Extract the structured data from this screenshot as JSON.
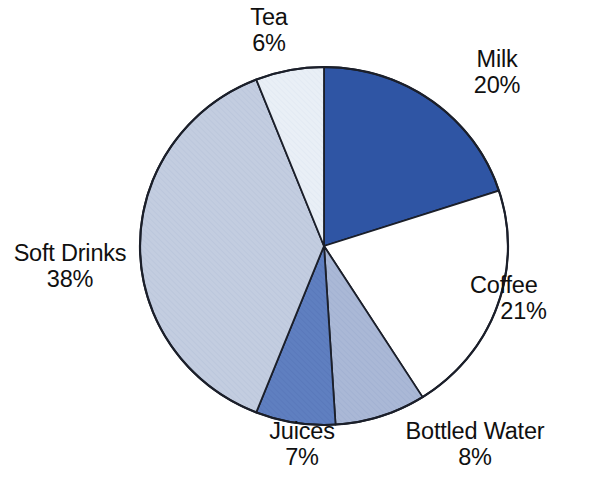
{
  "chart_data": {
    "type": "pie",
    "title": "",
    "subtitle": "",
    "xlabel": "",
    "ylabel": "",
    "legend_position": "none",
    "grid": false,
    "labels_position": "outside",
    "start_angle_deg": 0,
    "direction": "clockwise",
    "categories": [
      "Milk",
      "Coffee",
      "Bottled Water",
      "Juices",
      "Soft Drinks",
      "Tea"
    ],
    "values": [
      20,
      21,
      8,
      7,
      38,
      6
    ],
    "value_unit": "%",
    "slices": [
      {
        "label": "Milk",
        "percent": 20,
        "percent_text": "20%",
        "color": "#2f55a4",
        "start_deg": 0.0,
        "end_deg": 72.0
      },
      {
        "label": "Coffee",
        "percent": 21,
        "percent_text": "21%",
        "color": "#ffffff",
        "start_deg": 72.0,
        "end_deg": 147.6
      },
      {
        "label": "Bottled Water",
        "percent": 8,
        "percent_text": "8%",
        "color": "#aab8d6",
        "start_deg": 147.6,
        "end_deg": 176.4
      },
      {
        "label": "Juices",
        "percent": 7,
        "percent_text": "7%",
        "color": "#5f7fc0",
        "start_deg": 176.4,
        "end_deg": 201.6
      },
      {
        "label": "Soft Drinks",
        "percent": 38,
        "percent_text": "38%",
        "color": "#c3cde0",
        "start_deg": 201.6,
        "end_deg": 338.4
      },
      {
        "label": "Tea",
        "percent": 6,
        "percent_text": "6%",
        "color": "#e9eff6",
        "start_deg": 338.4,
        "end_deg": 360.0
      }
    ],
    "outline_color": "#1b1f2a"
  },
  "labels": {
    "tea": {
      "name": "Tea",
      "percent": "6%"
    },
    "milk": {
      "name": "Milk",
      "percent": "20%"
    },
    "coffee": {
      "name": "Coffee",
      "percent": "21%"
    },
    "soft_drinks": {
      "name": "Soft Drinks",
      "percent": "38%"
    },
    "juices": {
      "name": "Juices",
      "percent": "7%"
    },
    "bottled_water": {
      "name": "Bottled Water",
      "percent": "8%"
    }
  }
}
